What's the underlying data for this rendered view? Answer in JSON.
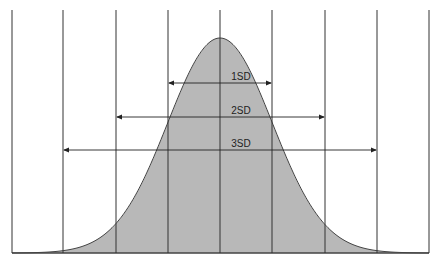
{
  "diagram": {
    "title": "",
    "type": "normal-distribution",
    "fill_color": "#b8b8b8",
    "line_color": "#333333",
    "mean_x": 220,
    "sd_px": 52.2,
    "baseline_y": 253,
    "peak_y": 38,
    "vertical_lines_x": [
      12,
      63,
      116,
      168,
      220,
      272,
      325,
      377,
      429
    ],
    "intervals": [
      {
        "label": "1SD",
        "y": 83,
        "x1": 168,
        "x2": 272
      },
      {
        "label": "2SD",
        "y": 117,
        "x1": 116,
        "x2": 325
      },
      {
        "label": "3SD",
        "y": 150,
        "x1": 63,
        "x2": 377
      }
    ]
  }
}
